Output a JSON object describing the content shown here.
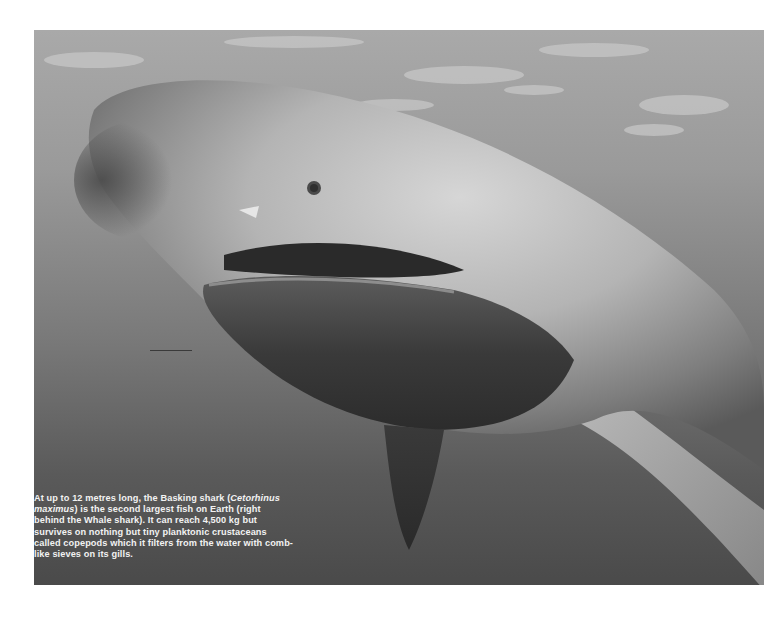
{
  "photo": {
    "subject": "Basking shark underwater, mouth open",
    "colors": {
      "water_top": "#a9a9a9",
      "water_bottom": "#4a4a4a",
      "shark_light": "#d0d0d0",
      "shark_dark": "#2e2e2e"
    }
  },
  "caption": {
    "part1": "At up to 12 metres long, the Basking shark (",
    "species": "Cetorhinus maximus",
    "part2": ") is the second largest fish on Earth (right behind the Whale shark). It can reach 4,500 kg but survives on nothing but tiny planktonic crustaceans called copepods which it filters from the water with comb-like sieves on its gills."
  }
}
